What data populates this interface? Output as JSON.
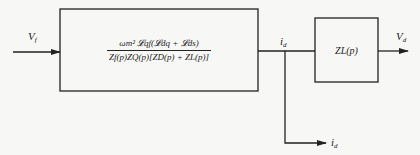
{
  "diagram": {
    "type": "block-diagram",
    "input_signal": {
      "label": "V_f",
      "text": "V",
      "sub": "f"
    },
    "main_block": {
      "numerator": "ωm² 𝓛qf(𝓛dq + 𝓛ds)",
      "denominator": "Zf(p)ZQ(p)[ZD(p) + ZL(p)]"
    },
    "intermediate_signal": {
      "label": "i_d",
      "text": "i",
      "sub": "d"
    },
    "load_block": {
      "label": "ZL(p)"
    },
    "output_signal": {
      "label": "V_d",
      "text": "V",
      "sub": "d"
    },
    "branch_signal": {
      "label": "i_d",
      "text": "i",
      "sub": "d"
    }
  },
  "colors": {
    "line": "#222222",
    "background": "#f7f7f5"
  }
}
